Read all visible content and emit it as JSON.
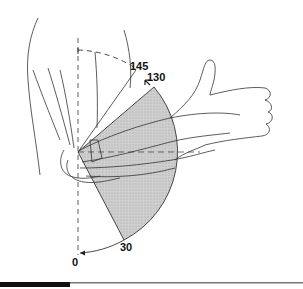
{
  "figure": {
    "type": "elbow-range-of-motion",
    "angle_labels": {
      "flexion_max": "145",
      "flexion_functional": "130",
      "functional_low": "30",
      "extension": "0"
    },
    "colors": {
      "sector_fill": "#c9c9c9",
      "line": "#222222",
      "bottom_bar": "#111111",
      "bottom_rule": "#777777"
    }
  }
}
